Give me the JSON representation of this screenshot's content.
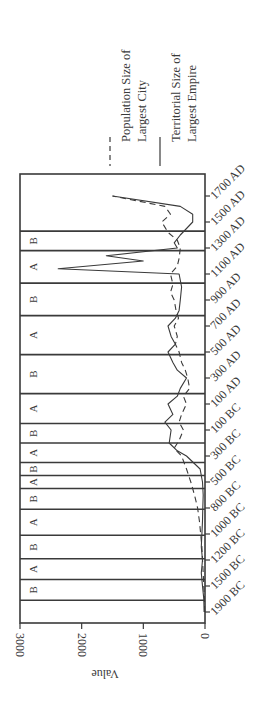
{
  "chart_data": {
    "type": "line",
    "orientation": "rotated-90-ccw",
    "title": "",
    "xlabel": "",
    "ylabel": "Value",
    "ylim": [
      0,
      3000
    ],
    "yticks": [
      0,
      1000,
      2000,
      3000
    ],
    "categories": [
      "1900 BC",
      "1500 BC",
      "1200 BC",
      "1000 BC",
      "800 BC",
      "500 BC",
      "300 BC",
      "100 BC",
      "100 AD",
      "300 AD",
      "500 AD",
      "700 AD",
      "900 AD",
      "1100 AD",
      "1300 AD",
      "1500 AD",
      "1700 AD"
    ],
    "grid": false,
    "legend_position": "right (top in rotated image)",
    "series": [
      {
        "name": "Population Size of Largest City",
        "style": "dashed",
        "points": [
          [
            0,
            5
          ],
          [
            0.5,
            10
          ],
          [
            1,
            20
          ],
          [
            1.5,
            30
          ],
          [
            2,
            40
          ],
          [
            2.5,
            50
          ],
          [
            3,
            70
          ],
          [
            3.5,
            90
          ],
          [
            4,
            120
          ],
          [
            4.5,
            170
          ],
          [
            5,
            230
          ],
          [
            5.5,
            300
          ],
          [
            6,
            380
          ],
          [
            6.3,
            500
          ],
          [
            6.6,
            420
          ],
          [
            7,
            350
          ],
          [
            7.3,
            420
          ],
          [
            7.6,
            380
          ],
          [
            8,
            300
          ],
          [
            8.3,
            350
          ],
          [
            8.6,
            250
          ],
          [
            9,
            280
          ],
          [
            9.3,
            320
          ],
          [
            9.6,
            380
          ],
          [
            10,
            420
          ],
          [
            10.3,
            480
          ],
          [
            10.6,
            450
          ],
          [
            11,
            500
          ],
          [
            11.3,
            430
          ],
          [
            11.6,
            470
          ],
          [
            12,
            500
          ],
          [
            12.3,
            560
          ],
          [
            12.6,
            520
          ],
          [
            13,
            560
          ],
          [
            13.3,
            450
          ],
          [
            13.6,
            420
          ],
          [
            14,
            400
          ],
          [
            14.3,
            450
          ],
          [
            14.6,
            600
          ],
          [
            15,
            700
          ],
          [
            15.3,
            560
          ],
          [
            15.6,
            650
          ],
          [
            16,
            1500
          ]
        ]
      },
      {
        "name": "Territorial Size of Largest Empire",
        "style": "solid",
        "points": [
          [
            0,
            15
          ],
          [
            0.5,
            20
          ],
          [
            1,
            40
          ],
          [
            1.5,
            60
          ],
          [
            2,
            40
          ],
          [
            2.5,
            60
          ],
          [
            3,
            50
          ],
          [
            3.5,
            40
          ],
          [
            4,
            35
          ],
          [
            4.5,
            30
          ],
          [
            5,
            40
          ],
          [
            5.5,
            80
          ],
          [
            6,
            300
          ],
          [
            6.2,
            450
          ],
          [
            6.5,
            580
          ],
          [
            7,
            550
          ],
          [
            7.3,
            650
          ],
          [
            7.6,
            520
          ],
          [
            8,
            600
          ],
          [
            8.3,
            450
          ],
          [
            8.6,
            400
          ],
          [
            9,
            300
          ],
          [
            9.3,
            450
          ],
          [
            9.6,
            520
          ],
          [
            10,
            600
          ],
          [
            10.3,
            480
          ],
          [
            10.6,
            550
          ],
          [
            11,
            600
          ],
          [
            11.3,
            480
          ],
          [
            11.6,
            420
          ],
          [
            12,
            400
          ],
          [
            12.5,
            380
          ],
          [
            13,
            420
          ],
          [
            13.2,
            2380
          ],
          [
            13.5,
            1000
          ],
          [
            13.7,
            1600
          ],
          [
            14,
            450
          ],
          [
            14.2,
            500
          ],
          [
            14.5,
            400
          ],
          [
            15,
            200
          ],
          [
            15.3,
            200
          ],
          [
            15.6,
            400
          ],
          [
            16,
            1500
          ]
        ]
      }
    ],
    "phases": [
      {
        "label": "",
        "from": 0,
        "to": 0.45
      },
      {
        "label": "B",
        "from": 0.45,
        "to": 1.25
      },
      {
        "label": "A",
        "from": 1.25,
        "to": 2.05
      },
      {
        "label": "B",
        "from": 2.05,
        "to": 2.95
      },
      {
        "label": "A",
        "from": 2.95,
        "to": 3.95
      },
      {
        "label": "B",
        "from": 3.95,
        "to": 4.75
      },
      {
        "label": "A",
        "from": 4.75,
        "to": 5.25
      },
      {
        "label": "B",
        "from": 5.25,
        "to": 5.75
      },
      {
        "label": "A",
        "from": 5.75,
        "to": 6.5
      },
      {
        "label": "B",
        "from": 6.5,
        "to": 7.25
      },
      {
        "label": "A",
        "from": 7.25,
        "to": 8.4
      },
      {
        "label": "B",
        "from": 8.4,
        "to": 9.9
      },
      {
        "label": "A",
        "from": 9.9,
        "to": 11.4
      },
      {
        "label": "B",
        "from": 11.4,
        "to": 12.65
      },
      {
        "label": "A",
        "from": 12.65,
        "to": 13.9
      },
      {
        "label": "B",
        "from": 13.9,
        "to": 14.65
      },
      {
        "label": "",
        "from": 14.65,
        "to": 16.5
      }
    ],
    "legend": [
      {
        "label_line1": "Population Size of",
        "label_line2": "Largest City",
        "style": "dashed"
      },
      {
        "label_line1": "Territorial Size of",
        "label_line2": "Largest Empire",
        "style": "solid"
      }
    ]
  }
}
